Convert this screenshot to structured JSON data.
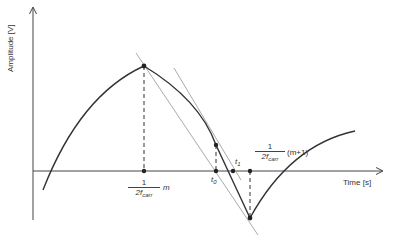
{
  "axes": {
    "y_label": "Amplitude [V]",
    "x_label": "Time [s]"
  },
  "labels": {
    "m_fraction": {
      "numerator": "1",
      "denominator_base": "2f",
      "denominator_sub": "carr",
      "suffix": "m"
    },
    "m1_fraction": {
      "numerator": "1",
      "denominator_base": "2f",
      "denominator_sub": "carr",
      "suffix": "(m+1)"
    },
    "t0": {
      "base": "t",
      "sub": "0"
    },
    "t1": {
      "base": "t",
      "sub": "1"
    }
  },
  "colors": {
    "curve": "#333333",
    "axis": "#444444",
    "tangent": "#9a9a9a",
    "dashed": "#333333"
  },
  "points": {
    "peak": [
      144,
      66
    ],
    "curve_point": [
      216,
      145
    ],
    "t0": [
      216,
      171
    ],
    "t1": [
      233,
      171
    ],
    "m_tick": [
      144,
      171
    ],
    "m1_tick": [
      250,
      171
    ],
    "minimum": [
      250,
      218
    ]
  }
}
